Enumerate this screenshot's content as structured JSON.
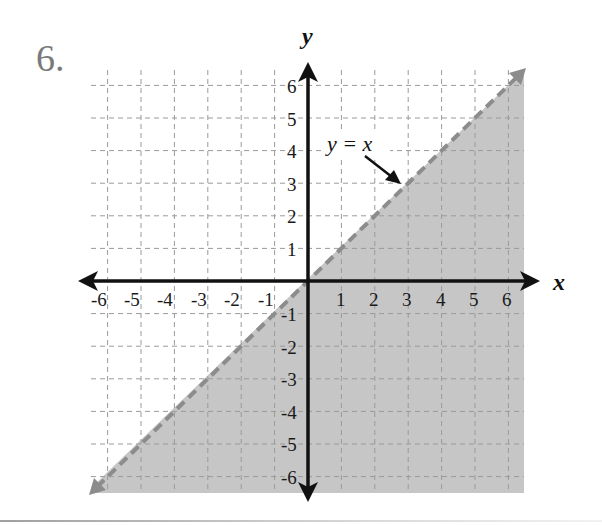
{
  "problem": {
    "number": "6."
  },
  "colors": {
    "shade": "#c6c6c6",
    "boundary": "#8c8c8c",
    "grid": "#9a9a9a",
    "axis": "#111111"
  },
  "chart_data": {
    "type": "inequality-graph",
    "title": "",
    "xlabel": "x",
    "ylabel": "y",
    "xlim": [
      -6,
      6
    ],
    "ylim": [
      -6,
      6
    ],
    "grid": true,
    "x_ticks": [
      -6,
      -5,
      -4,
      -3,
      -2,
      -1,
      1,
      2,
      3,
      4,
      5,
      6
    ],
    "y_ticks": [
      -6,
      -5,
      -4,
      -3,
      -2,
      -1,
      1,
      2,
      3,
      4,
      5,
      6
    ],
    "boundary": {
      "equation": "y = x",
      "style": "dashed",
      "points": [
        [
          -6.5,
          -6.5
        ],
        [
          6.5,
          6.5
        ]
      ]
    },
    "shaded_region": "below line (y < x)",
    "inequality": "y < x",
    "annotations": [
      {
        "text": "y = x",
        "points_to": [
          2.8,
          3.0
        ]
      }
    ]
  },
  "labels": {
    "x_axis": "x",
    "y_axis": "y",
    "equation": "y = x",
    "x_ticks": [
      "-6",
      "-5",
      "-4",
      "-3",
      "-2",
      "-1",
      "1",
      "2",
      "3",
      "4",
      "5",
      "6"
    ],
    "y_ticks_pos": [
      "1",
      "2",
      "3",
      "4",
      "5",
      "6"
    ],
    "y_ticks_neg": [
      "-1",
      "-2",
      "-3",
      "-4",
      "-5",
      "-6"
    ]
  }
}
